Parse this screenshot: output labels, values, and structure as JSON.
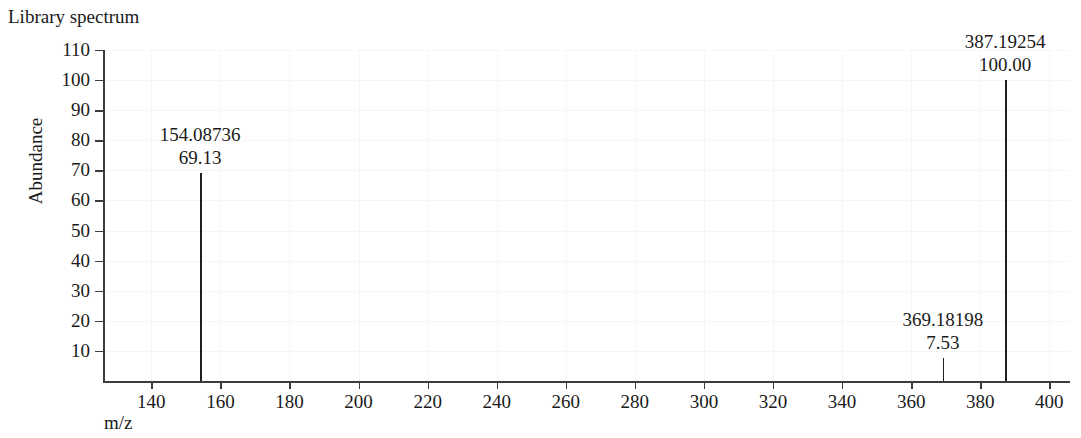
{
  "title": "Library spectrum",
  "axes": {
    "ylabel": "Abundance",
    "xlabel": "m/z",
    "y_ticks": [
      "10",
      "20",
      "30",
      "40",
      "50",
      "60",
      "70",
      "80",
      "90",
      "100",
      "110"
    ],
    "x_ticks": [
      "140",
      "160",
      "180",
      "200",
      "220",
      "240",
      "260",
      "280",
      "300",
      "320",
      "340",
      "360",
      "380",
      "400"
    ]
  },
  "peaks": [
    {
      "mz": "154.08736",
      "abundance": "69.13"
    },
    {
      "mz": "369.18198",
      "abundance": "7.53"
    },
    {
      "mz": "387.19254",
      "abundance": "100.00"
    }
  ],
  "chart_data": {
    "type": "bar",
    "title": "Library spectrum",
    "xlabel": "m/z",
    "ylabel": "Abundance",
    "xlim": [
      126,
      406
    ],
    "ylim": [
      0,
      110
    ],
    "xticks": [
      140,
      160,
      180,
      200,
      220,
      240,
      260,
      280,
      300,
      320,
      340,
      360,
      380,
      400
    ],
    "yticks": [
      10,
      20,
      30,
      40,
      50,
      60,
      70,
      80,
      90,
      100,
      110
    ],
    "grid": true,
    "legend": null,
    "x": [
      154.08736,
      369.18198,
      387.19254
    ],
    "values": [
      69.13,
      7.53,
      100.0
    ],
    "annotations": [
      {
        "x": 154.08736,
        "y": 69.13,
        "text": "154.08736\n69.13"
      },
      {
        "x": 369.18198,
        "y": 7.53,
        "text": "369.18198\n7.53"
      },
      {
        "x": 387.19254,
        "y": 100.0,
        "text": "387.19254\n100.00"
      }
    ]
  }
}
